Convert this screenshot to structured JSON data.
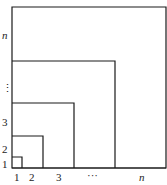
{
  "diagram": {
    "type": "nested-squares",
    "origin": "bottom-left",
    "stroke_color": "#1a1a1a",
    "squares": [
      {
        "label": "1"
      },
      {
        "label": "2"
      },
      {
        "label": "3"
      },
      {
        "label": "n-1"
      },
      {
        "label": "n"
      }
    ],
    "x_labels": [
      "1",
      "2",
      "3",
      "···",
      "n"
    ],
    "y_labels": [
      "1",
      "2",
      "3",
      "⋮",
      "n"
    ]
  }
}
